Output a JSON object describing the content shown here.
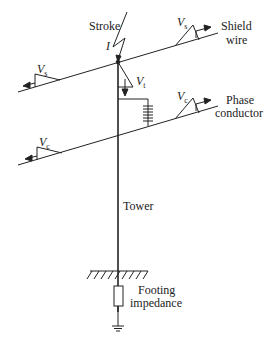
{
  "diagram": {
    "labels": {
      "stroke": "Stroke",
      "current": "I",
      "shield_wire_line1": "Shield",
      "shield_wire_line2": "wire",
      "phase_conductor_line1": "Phase",
      "phase_conductor_line2": "conductor",
      "tower": "Tower",
      "footing_line1": "Footing",
      "footing_line2": "impedance"
    },
    "voltages": {
      "shield_right": {
        "main": "V",
        "sub": "s"
      },
      "shield_left": {
        "main": "V",
        "sub": "s"
      },
      "tower": {
        "main": "V",
        "sub": "t"
      },
      "phase_right": {
        "main": "V",
        "sub": "c"
      },
      "phase_left": {
        "main": "V",
        "sub": "c"
      }
    },
    "colors": {
      "line": "#222222",
      "background": "#ffffff"
    }
  }
}
